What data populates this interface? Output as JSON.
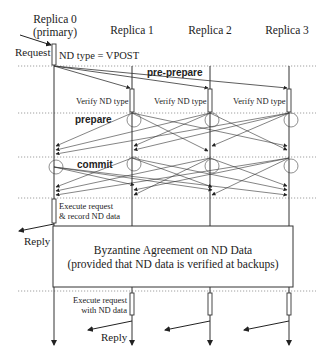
{
  "diagram": {
    "type": "sequence-diagram",
    "replicas": [
      {
        "name": "Replica 0",
        "subtitle": "(primary)"
      },
      {
        "name": "Replica 1"
      },
      {
        "name": "Replica 2"
      },
      {
        "name": "Replica 3"
      }
    ],
    "labels": {
      "request": "Request",
      "nd_type": "ND type = VPOST",
      "pre_prepare": "pre-prepare",
      "verify": "Verify ND type",
      "prepare": "prepare",
      "commit": "commit",
      "execute_record_line1": "Execute request",
      "execute_record_line2": "& record ND data",
      "reply": "Reply",
      "agreement_line1": "Byzantine Agreement on ND Data",
      "agreement_line2": "(provided that ND data is verified at backups)",
      "execute_nd_line1": "Execute request",
      "execute_nd_line2": "with ND data",
      "reply_backup": "Reply"
    },
    "phases": [
      "pre-prepare",
      "prepare",
      "commit"
    ],
    "colors": {
      "line": "#333333",
      "dotted": "#888888",
      "background": "#ffffff"
    }
  }
}
